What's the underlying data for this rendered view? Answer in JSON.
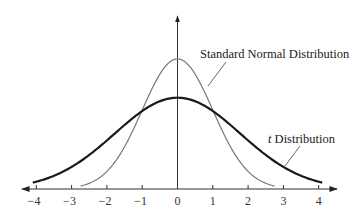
{
  "chart_data": {
    "type": "line",
    "title": "",
    "xlabel": "",
    "ylabel": "",
    "xlim": [
      -4.4,
      4.6
    ],
    "x_ticks": [
      -4,
      -3,
      -2,
      -1,
      0,
      1,
      2,
      3,
      4
    ],
    "x_tick_labels": [
      "−4",
      "−3",
      "−2",
      "−1",
      "0",
      "1",
      "2",
      "3",
      "4"
    ],
    "grid": false,
    "legend": "none (curves labeled by annotations with leader lines)",
    "series": [
      {
        "name": "Standard Normal Distribution",
        "color": "#777777",
        "line_width": 1.2,
        "x_range": [
          -2.75,
          2.75
        ],
        "peak": {
          "x": 0,
          "y": 0.399
        },
        "description": "taller, narrower bell curve"
      },
      {
        "name": "t Distribution",
        "color": "#1a1a1a",
        "line_width": 2.2,
        "x_range": [
          -4.1,
          4.1
        ],
        "peak": {
          "x": 0,
          "y": 0.28
        },
        "description": "shorter, wider curve with heavier tails"
      }
    ],
    "annotations": [
      {
        "text": "Standard Normal Distribution",
        "points_to": "normal curve right shoulder near x=0.9"
      },
      {
        "text_italic": "t",
        "text": " Distribution",
        "points_to": "t curve near x=3"
      }
    ],
    "intersections_approx_x": [
      -1.12,
      1.12
    ]
  },
  "labels": {
    "normal": "Standard Normal Distribution",
    "t_italic": "t",
    "t_rest": " Distribution"
  },
  "ticks": [
    "−4",
    "−3",
    "−2",
    "−1",
    "0",
    "1",
    "2",
    "3",
    "4"
  ]
}
